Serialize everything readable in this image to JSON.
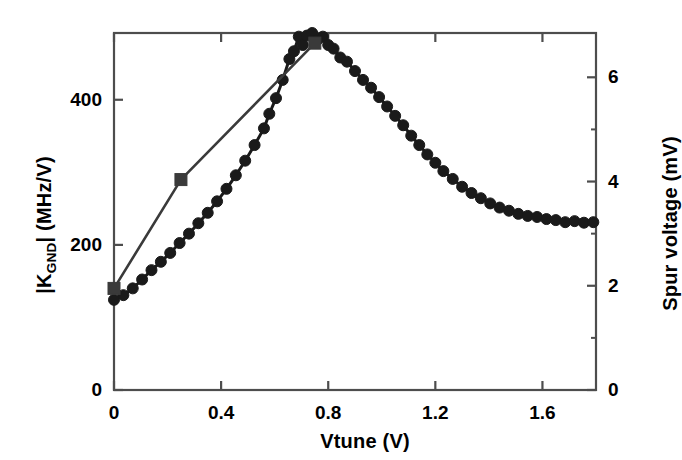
{
  "chart_data": {
    "type": "line",
    "title": "",
    "xlabel": "Vtune (V)",
    "ylabel": "|K_GND| (MHz/V)",
    "ylabel_right": "Spur voltage (mV)",
    "xlim": [
      0,
      1.8
    ],
    "ylim": [
      0,
      492
    ],
    "ylim_right": [
      0,
      6.85
    ],
    "xticks": [
      0,
      0.4,
      0.8,
      1.2,
      1.6
    ],
    "xtick_labels": [
      "0",
      "0.4",
      "0.8",
      "1.2",
      "1.6"
    ],
    "yticks": [
      0,
      200,
      400
    ],
    "ytick_labels": [
      "0",
      "200",
      "400"
    ],
    "yticks_right": [
      0,
      2,
      4,
      6
    ],
    "ytick_labels_right": [
      "0",
      "2",
      "4",
      "6"
    ],
    "yminor_right": [
      1,
      3,
      5
    ],
    "grid": false,
    "legend": "none",
    "axis_color": "#4d4d4d",
    "series": [
      {
        "name": "Spur voltage",
        "axis": "right",
        "marker": "circle",
        "color": "#1a1a1a",
        "marker_size": 11,
        "x": [
          0.0,
          0.035,
          0.07,
          0.105,
          0.14,
          0.175,
          0.21,
          0.245,
          0.28,
          0.315,
          0.35,
          0.385,
          0.42,
          0.455,
          0.49,
          0.525,
          0.56,
          0.58,
          0.605,
          0.63,
          0.655,
          0.672,
          0.69,
          0.705,
          0.72,
          0.74,
          0.76,
          0.78,
          0.8,
          0.82,
          0.845,
          0.87,
          0.9,
          0.93,
          0.96,
          0.99,
          1.02,
          1.05,
          1.08,
          1.11,
          1.14,
          1.17,
          1.2,
          1.23,
          1.265,
          1.3,
          1.335,
          1.37,
          1.405,
          1.44,
          1.475,
          1.51,
          1.545,
          1.58,
          1.615,
          1.65,
          1.685,
          1.72,
          1.755,
          1.79
        ],
        "y": [
          1.73,
          1.82,
          1.95,
          2.12,
          2.3,
          2.46,
          2.63,
          2.82,
          3.0,
          3.2,
          3.4,
          3.62,
          3.86,
          4.12,
          4.4,
          4.7,
          5.02,
          5.3,
          5.6,
          5.95,
          6.35,
          6.5,
          6.78,
          6.62,
          6.8,
          6.85,
          6.72,
          6.78,
          6.62,
          6.55,
          6.38,
          6.3,
          6.12,
          5.95,
          5.8,
          5.62,
          5.44,
          5.26,
          5.08,
          4.88,
          4.7,
          4.52,
          4.36,
          4.2,
          4.05,
          3.9,
          3.78,
          3.68,
          3.58,
          3.5,
          3.44,
          3.38,
          3.34,
          3.32,
          3.28,
          3.26,
          3.22,
          3.24,
          3.21,
          3.22
        ]
      },
      {
        "name": "|K_GND|",
        "axis": "left",
        "marker": "square",
        "color": "#3a3a3a",
        "marker_size": 12,
        "x": [
          0.0,
          0.25,
          0.75
        ],
        "y": [
          140,
          290,
          478
        ]
      }
    ]
  },
  "axes": {
    "x_title": "Vtune (V)",
    "y_left_title_pre": "|K",
    "y_left_title_sub": "GND",
    "y_left_title_post": "| (MHz/V)",
    "y_right_title": "Spur voltage (mV)"
  }
}
